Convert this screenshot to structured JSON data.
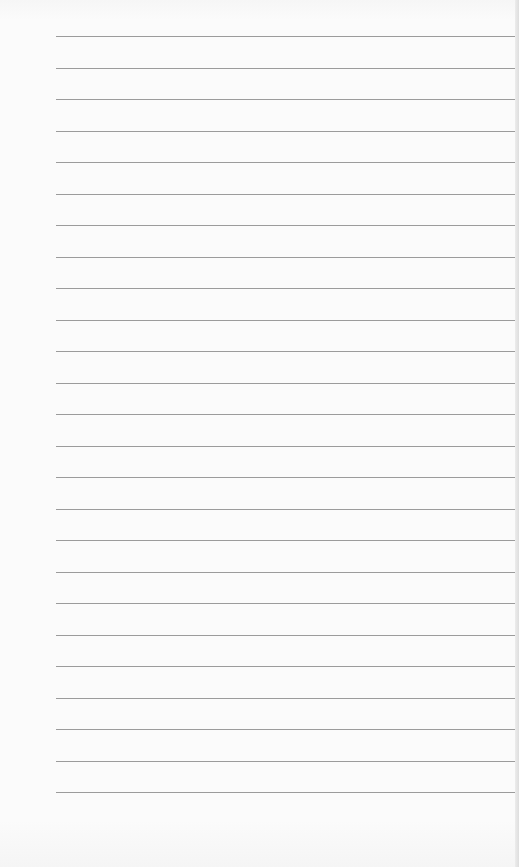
{
  "page": {
    "type": "lined-paper",
    "background_color": "#fbfbfb",
    "line_color": "#8a8a8a",
    "line_count": 25,
    "first_line_y": 36,
    "line_spacing": 31.5,
    "line_left": 56,
    "line_right": 515
  }
}
